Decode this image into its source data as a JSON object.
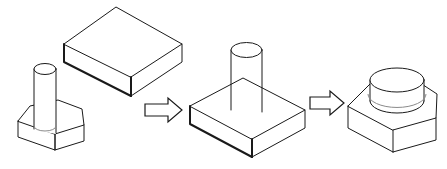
{
  "diagram": {
    "background_color": "#ffffff",
    "line_color": "#1a1a1a",
    "soft_line_color": "#8a8a8a",
    "face_color": "#ffffff",
    "canvas": {
      "width": 447,
      "height": 169
    },
    "steps": [
      {
        "id": "step-1",
        "label": "",
        "parts": [
          {
            "id": "part-pin-nut",
            "name": "hex nut with cylindrical pin",
            "shape": "hexagonal-prism-with-cylinder"
          },
          {
            "id": "part-block",
            "name": "rectangular block",
            "shape": "rectangular-box"
          }
        ]
      },
      {
        "id": "step-2",
        "label": "",
        "parts": [
          {
            "id": "part-block-with-pin",
            "name": "block with cylindrical pin protruding",
            "shape": "rectangular-box-with-cylinder"
          }
        ]
      },
      {
        "id": "step-3",
        "label": "",
        "parts": [
          {
            "id": "part-nut-with-boss",
            "name": "hex nut with cylindrical boss",
            "shape": "hexagonal-prism-with-boss"
          }
        ]
      }
    ],
    "arrows": [
      {
        "id": "arrow-1",
        "name": "right-arrow",
        "direction": "right",
        "glyph": "⇒"
      },
      {
        "id": "arrow-2",
        "name": "right-arrow",
        "direction": "right",
        "glyph": "⇒"
      }
    ]
  }
}
